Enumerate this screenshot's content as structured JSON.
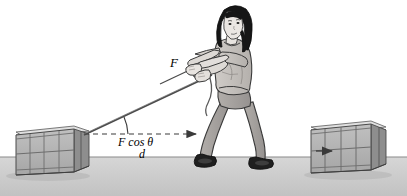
{
  "figure": {
    "name": "woman-pulling-crate-with-rope",
    "background_color": "#ffffff",
    "width": 407,
    "height": 196
  },
  "labels": {
    "force": "F",
    "horizontal_component": "F cos θ",
    "displacement": "d"
  },
  "colors": {
    "ink": "#3a3a3a",
    "outline": "#2b2b2b",
    "floor": "#c9c9c9",
    "floor_line": "#8a8a8a",
    "crate_front": "#b4b4b4",
    "crate_side": "#9a9a9a",
    "crate_top": "#d2d2d2",
    "crate_slat": "#6e6e6e",
    "skin": "#e8e4e0",
    "shirt": "#c4c0bc",
    "pants": "#a8a4a0",
    "hair": "#1a1a1a",
    "shoe": "#1f1f1f"
  },
  "scene": {
    "left_crate": {
      "name": "left-crate",
      "description": "wooden slatted crate being pulled"
    },
    "right_crate": {
      "name": "right-crate",
      "description": "wooden slatted crate with direction arrow"
    },
    "person": {
      "name": "woman-figure",
      "description": "woman leaning back pulling a rope"
    },
    "rope": {
      "name": "rope",
      "description": "taut rope from crate corner to hands"
    },
    "force_arrow": {
      "name": "force-vector-arrow",
      "description": "arrow along rope labeled F"
    },
    "displacement_arrow": {
      "name": "displacement-arrow",
      "description": "horizontal dashed arrow labeled d"
    },
    "angle_arc": {
      "name": "angle-arc",
      "description": "arc between rope and horizontal"
    },
    "floor": {
      "name": "floor",
      "description": "gray ground surface"
    }
  }
}
